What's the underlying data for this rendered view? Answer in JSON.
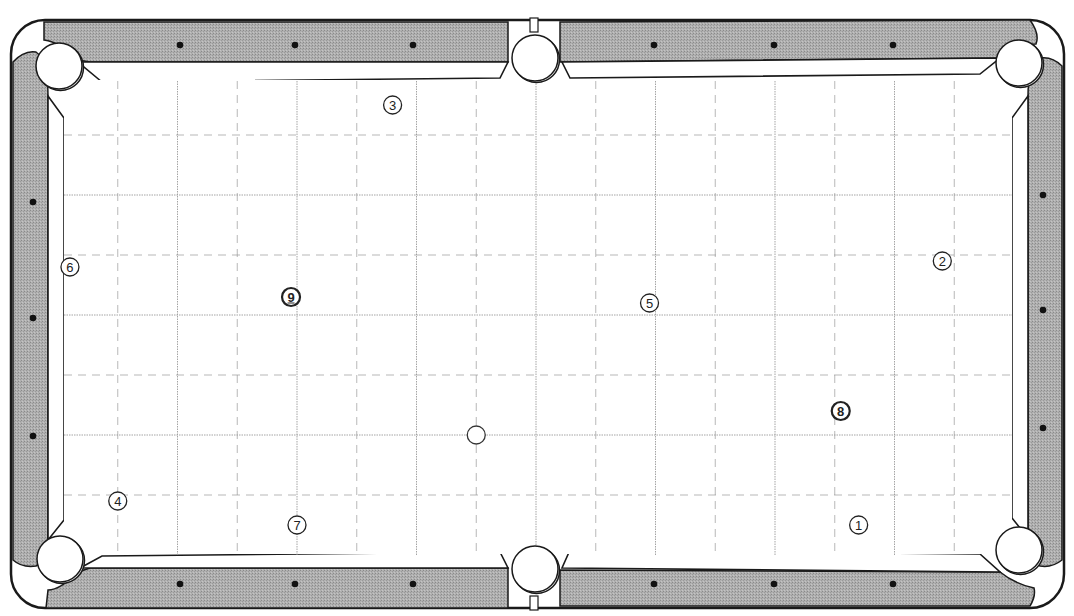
{
  "diagram": {
    "type": "pool-table-layout",
    "colors": {
      "rail": "#a9a9a9",
      "outline": "#1a1a1a",
      "cushion": "#ffffff",
      "cloth": "#ffffff",
      "grid": "#9a9a9a",
      "diamond": "#111111"
    },
    "grid": {
      "columns": 8,
      "rows": 4,
      "subdivided": true
    },
    "pockets": [
      {
        "id": "top-left"
      },
      {
        "id": "top-middle"
      },
      {
        "id": "top-right"
      },
      {
        "id": "bottom-left"
      },
      {
        "id": "bottom-middle"
      },
      {
        "id": "bottom-right"
      }
    ],
    "cue_ball": {
      "label": "",
      "col": 3.5,
      "row": 3.0
    },
    "balls": [
      {
        "number": "1",
        "label": "①",
        "col": 6.7,
        "row": 3.75
      },
      {
        "number": "2",
        "label": "②",
        "col": 7.4,
        "row": 1.55
      },
      {
        "number": "3",
        "label": "③",
        "col": 2.8,
        "row": 0.25
      },
      {
        "number": "4",
        "label": "④",
        "col": 0.5,
        "row": 3.55
      },
      {
        "number": "5",
        "label": "⑤",
        "col": 4.95,
        "row": 1.9
      },
      {
        "number": "6",
        "label": "⑥",
        "col": 0.1,
        "row": 1.6
      },
      {
        "number": "7",
        "label": "⑦",
        "col": 2.0,
        "row": 3.75
      },
      {
        "number": "8",
        "label": "⑧",
        "col": 6.55,
        "row": 2.8
      },
      {
        "number": "9",
        "label": "⑨",
        "col": 1.95,
        "row": 1.85
      }
    ],
    "ball_emphasis": {
      "8": "bold",
      "9": "bold-underline"
    }
  }
}
